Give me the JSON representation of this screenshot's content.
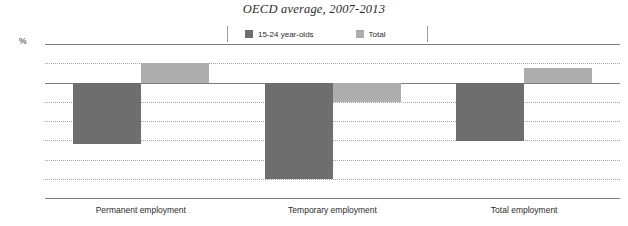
{
  "chart_data": {
    "type": "bar",
    "title": "OECD average, 2007-2013",
    "xlabel": "",
    "ylabel": "%",
    "ylim": [
      -12,
      4
    ],
    "ytick_step": 2,
    "yticks": [
      "4",
      "2",
      "0",
      "-2",
      "-4",
      "-6",
      "-8",
      "-10",
      "-12"
    ],
    "grid": true,
    "legend_position": "top-center",
    "categories": [
      "Permanent employment",
      "Temporary employment",
      "Total employment"
    ],
    "series": [
      {
        "name": "15-24 year-olds",
        "color": "#6e6e6e",
        "values": [
          -6.4,
          -10.0,
          -6.1
        ]
      },
      {
        "name": "Total",
        "color": "#adadad",
        "values": [
          2.0,
          -2.0,
          1.5
        ]
      }
    ]
  },
  "colors": {
    "series_dark": "#6e6e6e",
    "series_light": "#adadad",
    "gridline": "#8fa9bd",
    "axisline": "#7d7d7d",
    "text": "#2b2b2b",
    "background": "#ffffff"
  }
}
